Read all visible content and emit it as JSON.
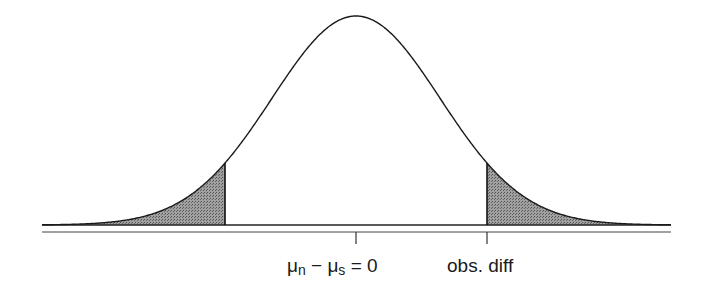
{
  "figure": {
    "type": "normal-distribution-two-tailed",
    "labels": {
      "center": {
        "mu": "μ",
        "sub_n": "n",
        "minus": " − ",
        "sub_s": "s",
        "eq": " = 0"
      },
      "obs": "obs. diff"
    },
    "geometry": {
      "mean_px": 356,
      "sigma_px": 84,
      "baseline_y": 225,
      "peak_y": 16,
      "x_start": 42,
      "x_end": 671,
      "axis_y": 232,
      "left_cut_px": 225,
      "right_cut_px": 487
    },
    "colors": {
      "curve": "#1a1a1a",
      "shade": "#8a8a8a",
      "axis": "#333333"
    }
  }
}
